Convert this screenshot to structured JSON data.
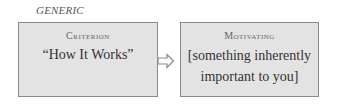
{
  "label": "GENERIC",
  "boxes": [
    {
      "heading": "Criterion",
      "body": "“How It Works”"
    },
    {
      "heading": "Motivating",
      "body_line1": "[something inherently",
      "body_line2": "important to you]"
    }
  ],
  "arrow": {
    "icon": "right-arrow-icon",
    "color": "#8a8a8a"
  }
}
